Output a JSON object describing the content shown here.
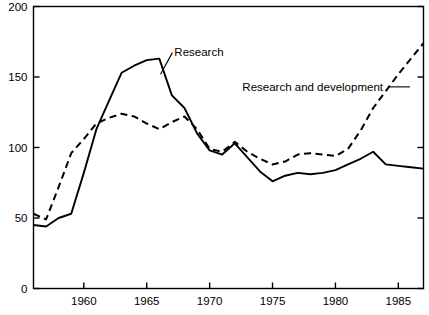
{
  "chart_data": {
    "type": "line",
    "title": "",
    "subtitle": "",
    "xlabel": "",
    "ylabel": "",
    "xlim": [
      1956,
      1987
    ],
    "ylim": [
      0,
      200
    ],
    "grid": false,
    "legend_position": "inline-annotations",
    "x_ticks": [
      1960,
      1965,
      1970,
      1975,
      1980,
      1985
    ],
    "x_tick_labels": [
      "1960",
      "1965",
      "1970",
      "1975",
      "1980",
      "1985"
    ],
    "y_ticks": [
      0,
      50,
      100,
      150,
      200
    ],
    "y_tick_labels": [
      "0",
      "50",
      "100",
      "150",
      "200"
    ],
    "x": [
      1956,
      1957,
      1958,
      1959,
      1960,
      1961,
      1962,
      1963,
      1964,
      1965,
      1966,
      1967,
      1968,
      1969,
      1970,
      1971,
      1972,
      1973,
      1974,
      1975,
      1976,
      1977,
      1978,
      1979,
      1980,
      1981,
      1982,
      1983,
      1984,
      1985,
      1986,
      1987
    ],
    "series": [
      {
        "name": "Research",
        "style": "solid",
        "color": "#000000",
        "label": "Research",
        "values": [
          45,
          44,
          50,
          53,
          82,
          113,
          133,
          153,
          158,
          162,
          163,
          137,
          128,
          110,
          98,
          95,
          103,
          93,
          83,
          76,
          80,
          82,
          81,
          82,
          84,
          88,
          92,
          97,
          88,
          87,
          86,
          85
        ]
      },
      {
        "name": "Research and development",
        "style": "dashed",
        "color": "#000000",
        "label": "Research and development",
        "values": [
          53,
          49,
          72,
          96,
          106,
          117,
          121,
          124,
          122,
          117,
          113,
          118,
          122,
          113,
          99,
          97,
          104,
          97,
          92,
          88,
          90,
          95,
          96,
          95,
          94,
          99,
          112,
          128,
          140,
          152,
          163,
          174
        ]
      }
    ],
    "annotations": [
      {
        "text": "Research",
        "x": 1966.8,
        "y": 168,
        "leader": true
      },
      {
        "text": "Research and development",
        "x": 1972.6,
        "y": 143,
        "leader": true
      }
    ]
  },
  "axes": {
    "left_axis_name": "y-axis",
    "bottom_axis_name": "x-axis",
    "right_axis_name": "right-axis",
    "top_axis_name": "top-axis"
  }
}
